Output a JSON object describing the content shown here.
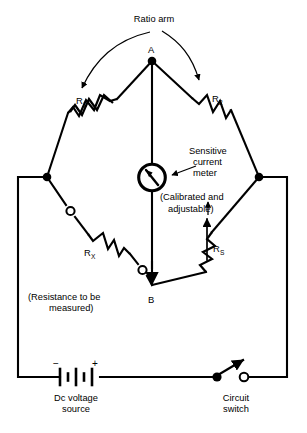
{
  "diagram": {
    "colors": {
      "ink": "#000000",
      "background": "#ffffff"
    },
    "nodes": {
      "top_label": "A",
      "bottom_label": "B"
    },
    "annotations": {
      "ratio_arm": "Ratio arm",
      "meter_line1": "Sensitive",
      "meter_line2": "current",
      "meter_line3": "meter",
      "calibrated_line1": "(Calibrated and",
      "calibrated_line2": "adjustable)",
      "resistance_line1": "(Resistance to be",
      "resistance_line2": "measured)",
      "source_line1": "Dc voltage",
      "source_line2": "source",
      "switch_line1": "Circuit",
      "switch_line2": "switch"
    },
    "components": {
      "r1": {
        "label": "R",
        "sub": "1"
      },
      "r2": {
        "label": "R",
        "sub": "2"
      },
      "rx": {
        "label": "R",
        "sub": "X"
      },
      "rs": {
        "label": "R",
        "sub": "S"
      },
      "battery": {
        "minus": "−",
        "plus": "+"
      }
    }
  }
}
